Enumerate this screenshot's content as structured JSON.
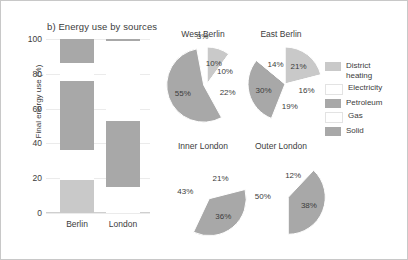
{
  "figure": {
    "panel_title": "b) Energy use by sources"
  },
  "legend": {
    "position": "right",
    "items": [
      {
        "label": "District\nheating",
        "color": "#c9c9c9"
      },
      {
        "label": "Electricity",
        "color": "#ffffff"
      },
      {
        "label": "Petroleum",
        "color": "#a8a8a8"
      },
      {
        "label": "Gas",
        "color": "#ffffff"
      },
      {
        "label": "Solid",
        "color": "#a8a8a8"
      }
    ]
  },
  "chart_data": [
    {
      "type": "bar",
      "title": "b) Energy use by sources",
      "xlabel": "",
      "ylabel": "Final energy use (%)",
      "ylim": [
        0,
        100
      ],
      "yticks": [
        0,
        20,
        40,
        60,
        80,
        100
      ],
      "grid": true,
      "stacked": true,
      "categories": [
        "Berlin",
        "London"
      ],
      "series": [
        {
          "name": "District heating",
          "values": [
            19,
            0
          ],
          "color": "#c9c9c9"
        },
        {
          "name": "Electricity",
          "values": [
            17,
            15
          ],
          "color": "#ffffff"
        },
        {
          "name": "Petroleum",
          "values": [
            40,
            38
          ],
          "color": "#a8a8a8"
        },
        {
          "name": "Gas",
          "values": [
            10,
            46
          ],
          "color": "#ffffff"
        },
        {
          "name": "Solid",
          "values": [
            14,
            1
          ],
          "color": "#a8a8a8"
        }
      ]
    },
    {
      "type": "pie",
      "title": "West Berlin",
      "labels": [
        "District heating",
        "Electricity",
        "Petroleum",
        "Gas",
        "Solid"
      ],
      "values": [
        10,
        10,
        22,
        55,
        3
      ],
      "display_labels": [
        "10%",
        "10%",
        "22%",
        "55%",
        "3%"
      ],
      "colors": [
        "#c9c9c9",
        "#ffffff",
        "#ffffff",
        "#a8a8a8",
        "#ffffff"
      ]
    },
    {
      "type": "pie",
      "title": "East Berlin",
      "labels": [
        "District heating",
        "Electricity",
        "Petroleum",
        "Gas",
        "Solid"
      ],
      "values": [
        21,
        16,
        19,
        30,
        14
      ],
      "display_labels": [
        "21%",
        "16%",
        "19%",
        "30%",
        "14%"
      ],
      "colors": [
        "#c9c9c9",
        "#ffffff",
        "#ffffff",
        "#a8a8a8",
        "#ffffff"
      ]
    },
    {
      "type": "pie",
      "title": "Inner London",
      "labels": [
        "Electricity",
        "Petroleum",
        "Gas"
      ],
      "values": [
        21,
        36,
        43
      ],
      "display_labels": [
        "21%",
        "36%",
        "43%"
      ],
      "colors": [
        "#ffffff",
        "#a8a8a8",
        "#ffffff"
      ]
    },
    {
      "type": "pie",
      "title": "Outer London",
      "labels": [
        "Electricity",
        "Petroleum",
        "Gas"
      ],
      "values": [
        12,
        38,
        50
      ],
      "display_labels": [
        "12%",
        "38%",
        "50%"
      ],
      "colors": [
        "#ffffff",
        "#a8a8a8",
        "#ffffff"
      ]
    }
  ],
  "pies": {
    "west_berlin": {
      "title": "West Berlin",
      "labels": [
        "3%",
        "10%",
        "10%",
        "22%",
        "55%"
      ]
    },
    "east_berlin": {
      "title": "East Berlin",
      "labels": [
        "21%",
        "16%",
        "19%",
        "30%",
        "14%"
      ]
    },
    "inner_london": {
      "title": "Inner London",
      "labels": [
        "21%",
        "36%",
        "43%"
      ]
    },
    "outer_london": {
      "title": "Outer London",
      "labels": [
        "12%",
        "38%",
        "50%"
      ]
    }
  },
  "bar_axis": {
    "ticks": [
      "100",
      "80",
      "60",
      "40",
      "20",
      "0"
    ],
    "categories": [
      "Berlin",
      "London"
    ],
    "y_title": "Final energy use (%)"
  }
}
